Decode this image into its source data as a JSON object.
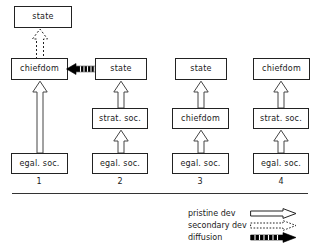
{
  "figure": {
    "title": "",
    "caption": ""
  },
  "columns": [
    {
      "number": "1",
      "cx": 39
    },
    {
      "number": "2",
      "cx": 120
    },
    {
      "number": "3",
      "cx": 200
    },
    {
      "number": "4",
      "cx": 281
    }
  ],
  "nodes": [
    {
      "id": "c1-top",
      "label": "state",
      "x": 14,
      "y": 6,
      "w": 58,
      "h": 22,
      "column": 1,
      "row": "top"
    },
    {
      "id": "c1-upper",
      "label": "chiefdom",
      "x": 11,
      "y": 58,
      "w": 57,
      "h": 22,
      "column": 1,
      "row": "upper"
    },
    {
      "id": "c1-base",
      "label": "egal. soc.",
      "x": 11,
      "y": 153,
      "w": 57,
      "h": 21,
      "column": 1,
      "row": "base"
    },
    {
      "id": "c2-upper",
      "label": "state",
      "x": 95,
      "y": 58,
      "w": 52,
      "h": 22,
      "column": 2,
      "row": "upper"
    },
    {
      "id": "c2-mid",
      "label": "strat. soc.",
      "x": 92,
      "y": 108,
      "w": 56,
      "h": 21,
      "column": 2,
      "row": "mid"
    },
    {
      "id": "c2-base",
      "label": "egal. soc.",
      "x": 92,
      "y": 153,
      "w": 56,
      "h": 21,
      "column": 2,
      "row": "base"
    },
    {
      "id": "c3-upper",
      "label": "state",
      "x": 175,
      "y": 58,
      "w": 52,
      "h": 22,
      "column": 3,
      "row": "upper"
    },
    {
      "id": "c3-mid",
      "label": "chiefdom",
      "x": 172,
      "y": 108,
      "w": 57,
      "h": 21,
      "column": 3,
      "row": "mid"
    },
    {
      "id": "c3-base",
      "label": "egal. soc.",
      "x": 172,
      "y": 153,
      "w": 57,
      "h": 21,
      "column": 3,
      "row": "base"
    },
    {
      "id": "c4-upper",
      "label": "chiefdom",
      "x": 253,
      "y": 58,
      "w": 57,
      "h": 22,
      "column": 4,
      "row": "upper"
    },
    {
      "id": "c4-mid",
      "label": "strat. soc.",
      "x": 253,
      "y": 108,
      "w": 56,
      "h": 21,
      "column": 4,
      "row": "mid"
    },
    {
      "id": "c4-base",
      "label": "egal. soc.",
      "x": 253,
      "y": 153,
      "w": 56,
      "h": 21,
      "column": 4,
      "row": "base"
    }
  ],
  "edges": [
    {
      "id": "e1",
      "kind": "secondary-dev",
      "from": "c1-upper",
      "to": "c1-top",
      "direction": "up"
    },
    {
      "id": "e2",
      "kind": "pristine-dev",
      "from": "c1-base",
      "to": "c1-upper",
      "direction": "up"
    },
    {
      "id": "e3",
      "kind": "diffusion",
      "from": "c2-upper",
      "to": "c1-upper",
      "direction": "left"
    },
    {
      "id": "e4",
      "kind": "pristine-dev",
      "from": "c2-mid",
      "to": "c2-upper",
      "direction": "up"
    },
    {
      "id": "e5",
      "kind": "pristine-dev",
      "from": "c2-base",
      "to": "c2-mid",
      "direction": "up"
    },
    {
      "id": "e6",
      "kind": "pristine-dev",
      "from": "c3-mid",
      "to": "c3-upper",
      "direction": "up"
    },
    {
      "id": "e7",
      "kind": "pristine-dev",
      "from": "c3-base",
      "to": "c3-mid",
      "direction": "up"
    },
    {
      "id": "e8",
      "kind": "pristine-dev",
      "from": "c4-mid",
      "to": "c4-upper",
      "direction": "up"
    },
    {
      "id": "e9",
      "kind": "pristine-dev",
      "from": "c4-base",
      "to": "c4-mid",
      "direction": "up"
    }
  ],
  "legend": {
    "items": [
      {
        "label": "pristine dev",
        "glyph": "hollow-arrow-icon"
      },
      {
        "label": "secondary dev",
        "glyph": "dotted-arrow-icon"
      },
      {
        "label": "diffusion",
        "glyph": "solid-arrow-icon"
      }
    ]
  },
  "colors": {
    "stroke": "#222222",
    "fill": "#ffffff",
    "rule": "#333333",
    "text": "#1a1a1a",
    "diffusion": "#000000"
  }
}
